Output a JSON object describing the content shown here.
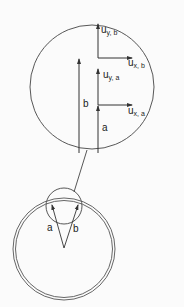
{
  "figure": {
    "colors": {
      "background": "#fbfbfb",
      "stroke": "#333333",
      "text": "#222222"
    }
  },
  "magnified_view": {
    "vector_b_label": "b",
    "vector_a_label": "a",
    "components": {
      "uy_b": {
        "base": "u",
        "sub": "y, b"
      },
      "ux_b": {
        "base": "u",
        "sub": "x, b"
      },
      "uy_a": {
        "base": "u",
        "sub": "y, a"
      },
      "ux_a": {
        "base": "u",
        "sub": "x, a"
      }
    }
  },
  "ring_view": {
    "label_a": "a",
    "label_b": "b"
  }
}
